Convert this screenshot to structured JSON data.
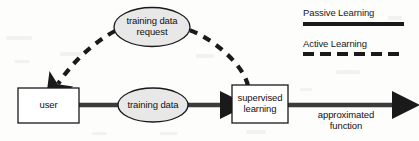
{
  "diagram": {
    "background_color": "#fdfdfc",
    "stroke_color": "#1a1a1a",
    "ellipse_fill": "#e8e8e8",
    "box_fill": "#ffffff",
    "nodes": [
      {
        "id": "training-data-request",
        "shape": "ellipse",
        "label_line1": "training data",
        "label_line2": "request",
        "cx": 152,
        "cy": 27,
        "rx": 38,
        "ry": 19.5,
        "fill": "#e8e8e8"
      },
      {
        "id": "user",
        "shape": "rect",
        "label_line1": "user",
        "label_line2": "",
        "x": 18,
        "y": 88,
        "width": 61,
        "height": 35,
        "fill": "#ffffff"
      },
      {
        "id": "training-data",
        "shape": "ellipse",
        "label_line1": "training data",
        "label_line2": "",
        "cx": 153,
        "cy": 105,
        "rx": 35,
        "ry": 17,
        "fill": "#e8e8e8"
      },
      {
        "id": "supervised-learning",
        "shape": "rect",
        "label_line1": "supervised",
        "label_line2": "learning",
        "x": 232,
        "y": 85,
        "width": 56,
        "height": 38,
        "fill": "#ffffff"
      }
    ],
    "edges": [
      {
        "id": "user-to-training-data",
        "style": "solid",
        "from": "user",
        "to": "training-data",
        "arrowhead": false
      },
      {
        "id": "training-data-to-supervised-learning",
        "style": "solid",
        "from": "training-data",
        "to": "supervised-learning",
        "arrowhead": true
      },
      {
        "id": "supervised-learning-to-output",
        "style": "solid",
        "from": "supervised-learning",
        "to": "approximated-function",
        "arrowhead": true,
        "label_line1": "approximated",
        "label_line2": "function"
      },
      {
        "id": "supervised-learning-to-request",
        "style": "dashed",
        "from": "supervised-learning",
        "to": "training-data-request",
        "arrowhead": false
      },
      {
        "id": "request-to-user",
        "style": "dashed",
        "from": "training-data-request",
        "to": "user",
        "arrowhead": true
      }
    ],
    "output_label": {
      "line1": "approximated",
      "line2": "function"
    }
  },
  "legend": {
    "items": [
      {
        "label": "Passive Learning",
        "style": "solid"
      },
      {
        "label": "Active Learning",
        "style": "dashed"
      }
    ]
  }
}
